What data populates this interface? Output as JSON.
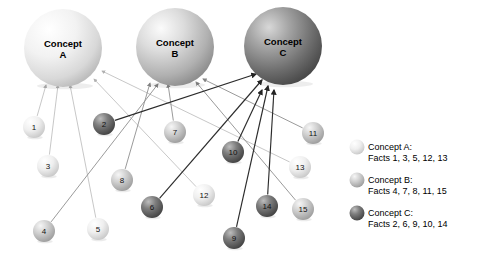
{
  "diagram": {
    "concepts": [
      {
        "id": "A",
        "label_line1": "Concept",
        "label_line2": "A",
        "cx": 63,
        "cy": 48,
        "r": 39,
        "shade": "light",
        "color": "#e9e9e9"
      },
      {
        "id": "B",
        "label_line1": "Concept",
        "label_line2": "B",
        "cx": 175,
        "cy": 47,
        "r": 39,
        "shade": "medium",
        "color": "#c3c3c3"
      },
      {
        "id": "C",
        "label_line1": "Concept",
        "label_line2": "C",
        "cx": 283,
        "cy": 46,
        "r": 39,
        "shade": "dark",
        "color": "#8d8d8d"
      }
    ],
    "facts": [
      {
        "id": 1,
        "label": "1",
        "cx": 34,
        "cy": 127,
        "r": 11,
        "concept": "A",
        "shade": "light"
      },
      {
        "id": 2,
        "label": "2",
        "cx": 104,
        "cy": 124,
        "r": 11,
        "concept": "C",
        "shade": "dark"
      },
      {
        "id": 3,
        "label": "3",
        "cx": 48,
        "cy": 166,
        "r": 11,
        "concept": "A",
        "shade": "light"
      },
      {
        "id": 4,
        "label": "4",
        "cx": 44,
        "cy": 231,
        "r": 11,
        "concept": "B",
        "shade": "medium"
      },
      {
        "id": 5,
        "label": "5",
        "cx": 98,
        "cy": 229,
        "r": 11,
        "concept": "A",
        "shade": "light"
      },
      {
        "id": 6,
        "label": "6",
        "cx": 152,
        "cy": 207,
        "r": 11,
        "concept": "C",
        "shade": "dark"
      },
      {
        "id": 7,
        "label": "7",
        "cx": 175,
        "cy": 132,
        "r": 11,
        "concept": "B",
        "shade": "medium"
      },
      {
        "id": 8,
        "label": "8",
        "cx": 122,
        "cy": 180,
        "r": 11,
        "concept": "B",
        "shade": "medium"
      },
      {
        "id": 9,
        "label": "9",
        "cx": 234,
        "cy": 238,
        "r": 11,
        "concept": "C",
        "shade": "dark"
      },
      {
        "id": 10,
        "label": "10",
        "cx": 233,
        "cy": 152,
        "r": 11,
        "concept": "C",
        "shade": "dark"
      },
      {
        "id": 11,
        "label": "11",
        "cx": 313,
        "cy": 133,
        "r": 11,
        "concept": "B",
        "shade": "medium"
      },
      {
        "id": 12,
        "label": "12",
        "cx": 204,
        "cy": 195,
        "r": 11,
        "concept": "A",
        "shade": "light"
      },
      {
        "id": 13,
        "label": "13",
        "cx": 300,
        "cy": 167,
        "r": 11,
        "concept": "A",
        "shade": "light"
      },
      {
        "id": 14,
        "label": "14",
        "cx": 267,
        "cy": 206,
        "r": 11,
        "concept": "C",
        "shade": "dark"
      },
      {
        "id": 15,
        "label": "15",
        "cx": 303,
        "cy": 209,
        "r": 11,
        "concept": "B",
        "shade": "medium"
      }
    ],
    "edges": [
      {
        "from": 1,
        "to": "A",
        "tx": 46,
        "ty": 85,
        "shade": "light"
      },
      {
        "from": 3,
        "to": "A",
        "tx": 58,
        "ty": 85,
        "shade": "light"
      },
      {
        "from": 5,
        "to": "A",
        "tx": 70,
        "ty": 85,
        "shade": "light"
      },
      {
        "from": 12,
        "to": "A",
        "tx": 94,
        "ty": 79,
        "shade": "light"
      },
      {
        "from": 13,
        "to": "A",
        "tx": 102,
        "ty": 71,
        "shade": "light"
      },
      {
        "from": 4,
        "to": "B",
        "tx": 158,
        "ty": 84,
        "shade": "medium"
      },
      {
        "from": 7,
        "to": "B",
        "tx": 168,
        "ty": 84,
        "shade": "medium"
      },
      {
        "from": 8,
        "to": "B",
        "tx": 150,
        "ty": 83,
        "shade": "medium"
      },
      {
        "from": 11,
        "to": "B",
        "tx": 203,
        "ty": 79,
        "shade": "medium"
      },
      {
        "from": 15,
        "to": "B",
        "tx": 196,
        "ty": 82,
        "shade": "medium"
      },
      {
        "from": 2,
        "to": "C",
        "tx": 256,
        "ty": 74,
        "shade": "dark"
      },
      {
        "from": 6,
        "to": "C",
        "tx": 262,
        "ty": 80,
        "shade": "dark"
      },
      {
        "from": 9,
        "to": "C",
        "tx": 268,
        "ty": 86,
        "shade": "dark"
      },
      {
        "from": 10,
        "to": "C",
        "tx": 262,
        "ty": 90,
        "shade": "dark"
      },
      {
        "from": 14,
        "to": "C",
        "tx": 274,
        "ty": 90,
        "shade": "dark"
      }
    ]
  },
  "legend": {
    "items": [
      {
        "shade": "light",
        "title": "Concept A:",
        "facts": "Facts 1, 3, 5, 12, 13",
        "cx": 357,
        "cy": 147
      },
      {
        "shade": "medium",
        "title": "Concept B:",
        "facts": "Facts 4, 7, 8, 11, 15",
        "cx": 357,
        "cy": 180
      },
      {
        "shade": "dark",
        "title": "Concept C:",
        "facts": "Facts 2, 6, 9, 10, 14",
        "cx": 357,
        "cy": 213
      }
    ]
  },
  "colors": {
    "light": "#e4e4e4",
    "medium": "#bdbdbd",
    "dark": "#6f6f6f",
    "edge_light": "#b9b9b9",
    "edge_medium": "#8e8e8e",
    "edge_dark": "#2b2b2b",
    "background": "#ffffff",
    "text": "#000000"
  }
}
